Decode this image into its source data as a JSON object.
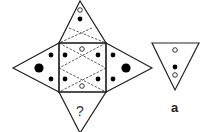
{
  "diagram": {
    "type": "pyramid-net-puzzle",
    "net": {
      "center_square": {
        "open_circles": 2,
        "filled_dots": 4,
        "pattern": "dashed double-X"
      },
      "top_triangle": {
        "open_circles": 1,
        "filled_dots": 1,
        "pattern": "dashed X"
      },
      "left_triangle": {
        "small_filled_dots": 2,
        "large_filled_dots": 1
      },
      "right_triangle": {
        "small_filled_dots": 2,
        "large_filled_dots": 1
      },
      "bottom_triangle": {
        "label": "?"
      }
    },
    "option": {
      "label": "a",
      "contents": [
        "open circle",
        "filled dot",
        "open circle"
      ]
    }
  },
  "colors": {
    "stroke": "#222222",
    "fill": "#000000",
    "background": "#ffffff"
  }
}
